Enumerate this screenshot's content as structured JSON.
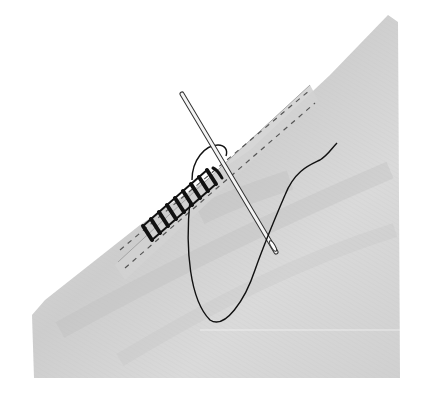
{
  "illustration": {
    "subject": "needle stitching a rolled fabric edge",
    "elements": [
      "fabric-piece",
      "rolled-hem",
      "whip-stitches",
      "basting-lines",
      "needle",
      "thread"
    ],
    "colors": {
      "background": "#ffffff",
      "fabric": "#d6d6d6",
      "fabric_shadow": "#bdbdbd",
      "fabric_highlight": "#ececec",
      "hem": "#cfcfcf",
      "thread": "#111111",
      "needle": "#f4f4f4",
      "needle_outline": "#333333"
    },
    "stitch_count": 9
  }
}
